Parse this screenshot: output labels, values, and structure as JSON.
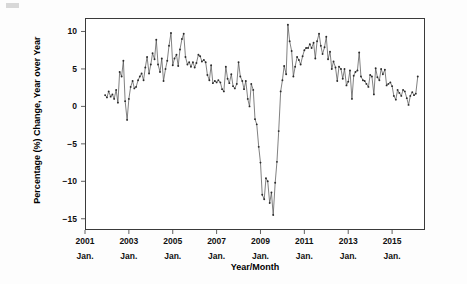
{
  "chart_data": {
    "type": "line",
    "title": "",
    "xlabel": "Year/Month",
    "ylabel": "Percentage (%) Change, Year over Year",
    "xlim": [
      2001.0,
      2016.5
    ],
    "ylim": [
      -16.5,
      11.8
    ],
    "yticks": [
      10,
      5,
      0,
      -5,
      -10,
      -15
    ],
    "ytick_labels": [
      "10",
      "5",
      "0",
      "-5",
      "-10",
      "-15"
    ],
    "xticks": [
      2001,
      2003,
      2005,
      2007,
      2009,
      2011,
      2013,
      2015
    ],
    "xtick_labels": [
      {
        "year": "2001",
        "month": "Jan."
      },
      {
        "year": "2003",
        "month": "Jan."
      },
      {
        "year": "2005",
        "month": "Jan."
      },
      {
        "year": "2007",
        "month": "Jan."
      },
      {
        "year": "2009",
        "month": "Jan."
      },
      {
        "year": "2011",
        "month": "Jan."
      },
      {
        "year": "2013",
        "month": "Jan."
      },
      {
        "year": "2015",
        "month": "Jan."
      }
    ],
    "grid": false,
    "legend": "none",
    "marker": "point",
    "line_color": "#4a4a4a",
    "marker_color": "#2b2b2b",
    "frame_color": "#3a3a3a",
    "series": [
      {
        "name": "Percentage Change, Year over Year",
        "x": [
          2001.92,
          2002.0,
          2002.08,
          2002.17,
          2002.25,
          2002.33,
          2002.42,
          2002.5,
          2002.58,
          2002.67,
          2002.75,
          2002.83,
          2002.92,
          2003.0,
          2003.08,
          2003.17,
          2003.25,
          2003.33,
          2003.42,
          2003.5,
          2003.58,
          2003.67,
          2003.75,
          2003.83,
          2003.92,
          2004.0,
          2004.08,
          2004.17,
          2004.25,
          2004.33,
          2004.42,
          2004.5,
          2004.58,
          2004.67,
          2004.75,
          2004.83,
          2004.92,
          2005.0,
          2005.08,
          2005.17,
          2005.25,
          2005.33,
          2005.42,
          2005.5,
          2005.58,
          2005.67,
          2005.75,
          2005.83,
          2005.92,
          2006.0,
          2006.08,
          2006.17,
          2006.25,
          2006.33,
          2006.42,
          2006.5,
          2006.58,
          2006.67,
          2006.75,
          2006.83,
          2006.92,
          2007.0,
          2007.08,
          2007.17,
          2007.25,
          2007.33,
          2007.42,
          2007.5,
          2007.58,
          2007.67,
          2007.75,
          2007.83,
          2007.92,
          2008.0,
          2008.08,
          2008.17,
          2008.25,
          2008.33,
          2008.42,
          2008.5,
          2008.58,
          2008.67,
          2008.75,
          2008.83,
          2008.92,
          2009.0,
          2009.08,
          2009.17,
          2009.25,
          2009.33,
          2009.42,
          2009.5,
          2009.58,
          2009.67,
          2009.75,
          2009.83,
          2009.92,
          2010.0,
          2010.08,
          2010.17,
          2010.25,
          2010.33,
          2010.42,
          2010.5,
          2010.58,
          2010.67,
          2010.75,
          2010.83,
          2010.92,
          2011.0,
          2011.08,
          2011.17,
          2011.25,
          2011.33,
          2011.42,
          2011.5,
          2011.58,
          2011.67,
          2011.75,
          2011.83,
          2011.92,
          2012.0,
          2012.08,
          2012.17,
          2012.25,
          2012.33,
          2012.42,
          2012.5,
          2012.58,
          2012.67,
          2012.75,
          2012.83,
          2012.92,
          2013.0,
          2013.08,
          2013.17,
          2013.25,
          2013.33,
          2013.42,
          2013.5,
          2013.58,
          2013.67,
          2013.75,
          2013.83,
          2013.92,
          2014.0,
          2014.08,
          2014.17,
          2014.25,
          2014.33,
          2014.42,
          2014.5,
          2014.58,
          2014.67,
          2014.75,
          2014.83,
          2014.92,
          2015.0,
          2015.08,
          2015.17,
          2015.25,
          2015.33,
          2015.42,
          2015.5,
          2015.58,
          2015.67,
          2015.75,
          2015.83,
          2015.92,
          2016.0,
          2016.08,
          2016.17
        ],
        "values": [
          1.5,
          1.2,
          2.0,
          1.3,
          1.6,
          1.0,
          2.2,
          0.5,
          4.6,
          4.0,
          6.1,
          0.7,
          -1.8,
          1.0,
          2.6,
          3.4,
          2.4,
          2.6,
          3.5,
          4.0,
          4.4,
          3.5,
          5.2,
          6.6,
          4.4,
          5.6,
          7.1,
          6.3,
          8.9,
          5.6,
          4.6,
          6.4,
          3.4,
          5.0,
          6.1,
          8.1,
          9.8,
          5.5,
          6.4,
          6.9,
          5.4,
          7.6,
          9.0,
          9.7,
          6.6,
          5.6,
          5.9,
          5.3,
          5.9,
          5.2,
          5.8,
          6.9,
          6.7,
          6.0,
          6.2,
          5.9,
          4.2,
          3.5,
          5.5,
          3.1,
          3.4,
          3.2,
          3.5,
          3.2,
          2.3,
          2.0,
          5.3,
          3.7,
          3.1,
          4.3,
          2.7,
          2.4,
          3.0,
          5.9,
          4.0,
          3.4,
          2.3,
          3.4,
          1.0,
          0.0,
          3.0,
          2.2,
          -1.7,
          -2.4,
          -5.4,
          -7.5,
          -11.8,
          -12.4,
          -9.6,
          -10.0,
          -12.9,
          -11.5,
          -14.5,
          -10.2,
          -7.4,
          -3.3,
          2.0,
          3.5,
          5.4,
          4.3,
          10.9,
          8.7,
          7.4,
          4.0,
          5.3,
          6.6,
          6.2,
          5.6,
          6.7,
          7.5,
          7.8,
          7.8,
          8.3,
          7.8,
          8.5,
          6.4,
          8.7,
          9.7,
          8.1,
          7.0,
          7.9,
          9.3,
          6.3,
          7.3,
          5.0,
          6.0,
          5.2,
          3.4,
          5.3,
          5.0,
          3.7,
          5.0,
          2.8,
          3.3,
          4.8,
          1.0,
          4.1,
          4.6,
          4.8,
          7.2,
          4.0,
          3.5,
          3.4,
          3.0,
          2.6,
          4.2,
          4.0,
          1.6,
          5.1,
          3.9,
          3.5,
          5.0,
          4.3,
          4.9,
          2.8,
          3.0,
          3.2,
          2.7,
          1.4,
          0.9,
          2.2,
          1.8,
          1.4,
          2.2,
          2.0,
          1.1,
          0.2,
          1.4,
          1.9,
          1.5,
          1.7,
          4.0
        ]
      }
    ]
  },
  "axis": {
    "y_title": "Percentage (%) Change, Year over Year",
    "x_title": "Year/Month"
  }
}
